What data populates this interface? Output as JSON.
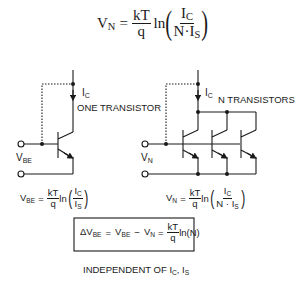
{
  "top_equation": {
    "lhs": "V",
    "lhs_sub": "N",
    "eq": "=",
    "frac_num": "kT",
    "frac_den": "q",
    "fn": "ln",
    "arg_num": "I",
    "arg_num_sub": "C",
    "arg_den_a": "N·I",
    "arg_den_sub": "S"
  },
  "left_circuit": {
    "current_label": "I",
    "current_sub": "C",
    "title": "ONE TRANSISTOR",
    "voltage_label": "V",
    "voltage_sub": "BE"
  },
  "right_circuit": {
    "current_label": "I",
    "current_sub": "C",
    "title": "N TRANSISTORS",
    "voltage_label": "V",
    "voltage_sub": "N"
  },
  "left_equation": {
    "lhs": "V",
    "lhs_sub": "BE",
    "eq": "=",
    "frac_num": "kT",
    "frac_den": "q",
    "fn": "ln",
    "arg_num": "I",
    "arg_num_sub": "C",
    "arg_den": "I",
    "arg_den_sub": "S"
  },
  "right_equation": {
    "lhs": "V",
    "lhs_sub": "N",
    "eq": "=",
    "frac_num": "kT",
    "frac_den": "q",
    "fn": "ln",
    "arg_num": "I",
    "arg_num_sub": "C",
    "arg_den": "N · I",
    "arg_den_sub": "S"
  },
  "boxed_equation": {
    "delta": "ΔV",
    "delta_sub": "BE",
    "eq1": "=",
    "vbe": "V",
    "vbe_sub": "BE",
    "minus": "−",
    "vn": "V",
    "vn_sub": "N",
    "eq2": "=",
    "frac_num": "kT",
    "frac_den": "q",
    "tail": "ln(N)"
  },
  "footer": {
    "text": "INDEPENDENT OF I",
    "sub1": "C",
    "comma": ", I",
    "sub2": "S"
  }
}
